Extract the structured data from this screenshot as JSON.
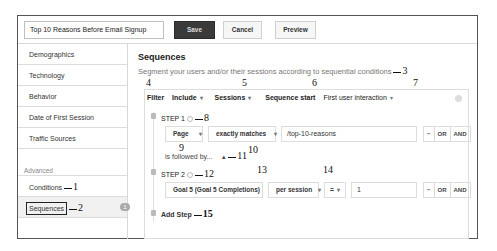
{
  "topbar": {
    "segment_name": "Top 10 Reasons Before Email Signup",
    "save_label": "Save",
    "cancel_label": "Cancel",
    "preview_label": "Preview"
  },
  "sidebar": {
    "items": [
      {
        "label": "Demographics"
      },
      {
        "label": "Technology"
      },
      {
        "label": "Behavior"
      },
      {
        "label": "Date of First Session"
      },
      {
        "label": "Traffic Sources"
      }
    ],
    "advanced_label": "Advanced",
    "advanced_items": [
      {
        "label": "Conditions",
        "annotation": "1"
      },
      {
        "label": "Sequences",
        "annotation": "2",
        "badge": "1"
      }
    ]
  },
  "main": {
    "title": "Sequences",
    "subtitle": "Segment your users and/or their sessions according to sequential conditions",
    "subtitle_annotation": "3",
    "filter": {
      "label": "Filter",
      "label_annotation": "4",
      "include": "Include",
      "scope": "Sessions",
      "scope_annotation": "5",
      "sequence_start_label": "Sequence start",
      "sequence_start_annotation": "6",
      "sequence_start_value": "First user interaction",
      "sequence_start_value_annotation": "7"
    },
    "steps": [
      {
        "label": "STEP 1",
        "annotation": "8",
        "dimension": "Page",
        "dimension_annotation": "9",
        "operator": "exactly matches",
        "operator_annotation": "10",
        "value": "/top-10-reasons",
        "followed_by": "is followed by...",
        "followed_annotation": "11",
        "minus": "−",
        "or": "OR",
        "and": "AND"
      },
      {
        "label": "STEP 2",
        "annotation": "12",
        "metric": "Goal 5 (Goal 5 Completions)",
        "metric_annotation": "13",
        "per": "per session",
        "per_annotation": "14",
        "comparator": "=",
        "value": "1",
        "minus": "−",
        "or": "OR",
        "and": "AND"
      }
    ],
    "add_step_label": "Add Step",
    "add_step_annotation": "15"
  }
}
